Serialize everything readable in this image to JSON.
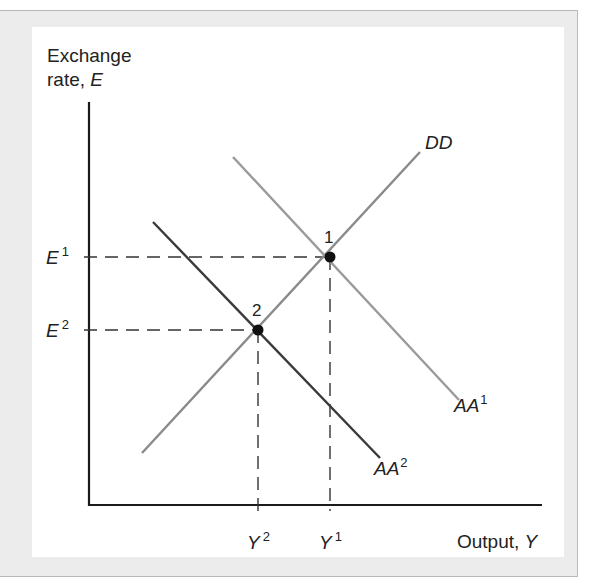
{
  "chart_data": {
    "type": "line",
    "title": "",
    "xlabel": "Output, Y",
    "ylabel": "Exchange rate, E",
    "ylabel_lines": [
      "Exchange",
      "rate, "
    ],
    "ylabel_var": "E",
    "xlabel_text": "Output, ",
    "xlabel_var": "Y",
    "grid": false,
    "series": [
      {
        "name": "DD",
        "label_base": "DD",
        "label_sup": "",
        "color": "#8a8a8a",
        "points": [
          [
            142,
            453
          ],
          [
            420,
            152
          ]
        ]
      },
      {
        "name": "AA1",
        "label_base": "AA",
        "label_sup": "1",
        "color": "#9a9a9a",
        "points": [
          [
            233,
            157
          ],
          [
            459,
            400
          ]
        ]
      },
      {
        "name": "AA2",
        "label_base": "AA",
        "label_sup": "2",
        "color": "#3a3a3a",
        "points": [
          [
            153,
            222
          ],
          [
            380,
            458
          ]
        ]
      }
    ],
    "equilibria": [
      {
        "id": "1",
        "label": "1",
        "E": "E1",
        "Y": "Y1",
        "x": 330,
        "y": 257
      },
      {
        "id": "2",
        "label": "2",
        "E": "E2",
        "Y": "Y2",
        "x": 258,
        "y": 330
      }
    ],
    "y_ticks": [
      {
        "base": "E",
        "sup": "1",
        "y": 257
      },
      {
        "base": "E",
        "sup": "2",
        "y": 330
      }
    ],
    "x_ticks": [
      {
        "base": "Y",
        "sup": "2",
        "x": 258
      },
      {
        "base": "Y",
        "sup": "1",
        "x": 330
      }
    ],
    "annotations": [
      "Shift of AA from AA1 to AA2 moves equilibrium from point 1 to point 2"
    ]
  }
}
